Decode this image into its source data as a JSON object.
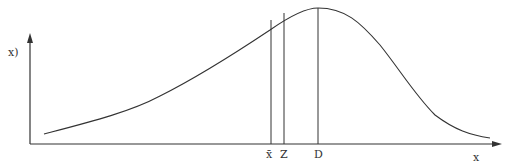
{
  "diagram": {
    "y_axis_label": "x)",
    "x_axis_label": "x",
    "markers": [
      {
        "label": "x̄",
        "name": "mean"
      },
      {
        "label": "Z",
        "name": "median"
      },
      {
        "label": "D",
        "name": "mode"
      }
    ],
    "colors": {
      "line": "#333333",
      "background": "#ffffff"
    }
  }
}
